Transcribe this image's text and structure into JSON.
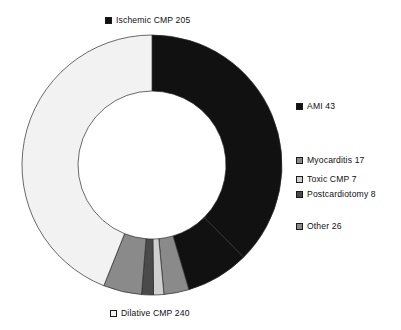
{
  "chart_data": {
    "type": "pie",
    "variant": "donut",
    "title": "",
    "subtitle": "",
    "xlabel": "",
    "ylabel": "",
    "grid": false,
    "legend_position": "callout-around-chart",
    "total": 546,
    "start_angle_deg": 0,
    "direction": "clockwise",
    "hole_ratio": 0.57,
    "categories": [
      "Ischemic CMP",
      "AMI",
      "Myocarditis",
      "Toxic CMP",
      "Postcardiotomy",
      "Other",
      "Dilative CMP"
    ],
    "values": [
      205,
      43,
      17,
      7,
      8,
      26,
      240
    ],
    "colors": [
      "#111111",
      "#111111",
      "#8a8a8a",
      "#d0d0d0",
      "#4a4a4a",
      "#8a8a8a",
      "#f2f2f2"
    ],
    "slices": [
      {
        "label": "Ischemic CMP",
        "value": 205,
        "text": "Ischemic CMP 205",
        "color": "#111111",
        "percent": 37.5
      },
      {
        "label": "AMI",
        "value": 43,
        "text": "AMI 43",
        "color": "#111111",
        "percent": 7.9
      },
      {
        "label": "Myocarditis",
        "value": 17,
        "text": "Myocarditis 17",
        "color": "#8a8a8a",
        "percent": 3.1
      },
      {
        "label": "Toxic CMP",
        "value": 7,
        "text": "Toxic CMP 7",
        "color": "#d0d0d0",
        "percent": 1.3
      },
      {
        "label": "Postcardiotomy",
        "value": 8,
        "text": "Postcardiotomy 8",
        "color": "#4a4a4a",
        "percent": 1.5
      },
      {
        "label": "Other",
        "value": 26,
        "text": "Other 26",
        "color": "#8a8a8a",
        "percent": 4.8
      },
      {
        "label": "Dilative CMP",
        "value": 240,
        "text": "Dilative CMP 240",
        "color": "#f2f2f2",
        "percent": 44.0
      }
    ]
  },
  "geometry": {
    "center_x": 152,
    "center_y": 165,
    "outer_radius": 130,
    "inner_radius": 74,
    "stroke_color": "#2b2b2b",
    "stroke_width": 0.7
  },
  "legend": {
    "ischemic_cmp": "Ischemic CMP 205",
    "ami": "AMI 43",
    "myocarditis": "Myocarditis 17",
    "toxic_cmp": "Toxic CMP 7",
    "postcardiotomy": "Postcardiotomy 8",
    "other": "Other 26",
    "dilative_cmp": "Dilative CMP 240"
  }
}
